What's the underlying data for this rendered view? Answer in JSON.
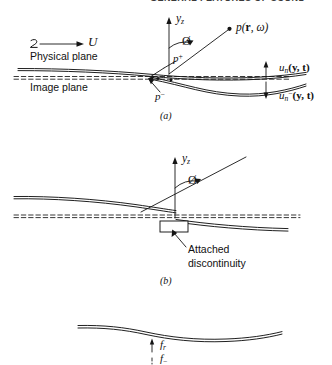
{
  "running_head": "GENERAL FEATURES OF SOUND",
  "figure": {
    "panels": [
      {
        "id": "a",
        "caption": "(a)",
        "labels": {
          "axis_y": "y",
          "axis_y_sub": "z",
          "angle": "Ø",
          "observer": "p(",
          "observer_vec": "r",
          "observer_rest": ", ω)",
          "flow": "U",
          "physical_plane": "Physical plane",
          "image_plane": "Image plane",
          "p_plus": "p",
          "p_plus_sup": "+",
          "p_minus": "p",
          "p_minus_sup": "−",
          "u_upper": "u",
          "u_upper_sub": "n",
          "u_upper_rest": "(y, t)",
          "u_lower": "u",
          "u_lower_sub": "n",
          "u_lower_sup": "−",
          "u_lower_rest": "(y, t)"
        }
      },
      {
        "id": "b",
        "caption": "(b)",
        "labels": {
          "axis_y": "y",
          "axis_y_sub": "z",
          "angle": "Ø",
          "annotation_line1": "Attached",
          "annotation_line2": "discontinuity"
        }
      },
      {
        "id": "c",
        "caption": "",
        "labels": {
          "f_upper": "f",
          "f_upper_sub": "r",
          "f_lower": "f",
          "f_lower_sub": "−"
        }
      }
    ]
  },
  "colors": {
    "ink": "#111111",
    "runhead": "#3a3a3a",
    "surface": "#1a1a1a"
  }
}
